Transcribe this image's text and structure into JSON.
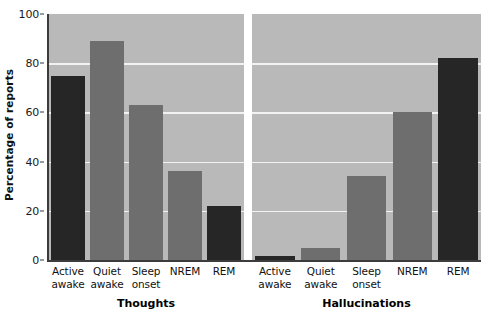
{
  "chart_data": {
    "type": "bar",
    "title": "",
    "xlabel": "",
    "ylabel": "Percentage of reports",
    "ylim": [
      0,
      100
    ],
    "yticks": [
      0,
      20,
      40,
      60,
      80,
      100
    ],
    "ytick_labels": [
      "0",
      "20",
      "40",
      "60",
      "80",
      "100"
    ],
    "grid": true,
    "legend": "none",
    "categories": [
      "Active awake",
      "Quiet awake",
      "Sleep onset",
      "NREM",
      "REM"
    ],
    "panels": [
      {
        "name": "Thoughts",
        "values": [
          75,
          89,
          63,
          36,
          22
        ],
        "bar_colors": [
          "#262626",
          "#6e6e6e",
          "#6e6e6e",
          "#6e6e6e",
          "#262626"
        ]
      },
      {
        "name": "Hallucinations",
        "values": [
          1.5,
          5,
          34,
          60,
          82
        ],
        "bar_colors": [
          "#262626",
          "#6e6e6e",
          "#6e6e6e",
          "#6e6e6e",
          "#262626"
        ]
      }
    ],
    "series": [
      {
        "name": "Thoughts",
        "values": [
          75,
          89,
          63,
          36,
          22
        ]
      },
      {
        "name": "Hallucinations",
        "values": [
          1.5,
          5,
          34,
          60,
          82
        ]
      }
    ],
    "colors": {
      "bar_dark": "#262626",
      "bar_gray": "#6e6e6e",
      "plot_background": "#b9b9b9",
      "gridline": "#f2f2f2",
      "axis": "#3c3c3c",
      "text": "#111111"
    }
  },
  "axis": {
    "y_title": "Percentage of reports"
  },
  "category_lines": [
    {
      "l1": "Active",
      "l2": "awake"
    },
    {
      "l1": "Quiet",
      "l2": "awake"
    },
    {
      "l1": "Sleep",
      "l2": "onset"
    },
    {
      "l1": "NREM",
      "l2": ""
    },
    {
      "l1": "REM",
      "l2": ""
    }
  ],
  "panel_titles": {
    "thoughts": "Thoughts",
    "hallucinations": "Hallucinations"
  }
}
